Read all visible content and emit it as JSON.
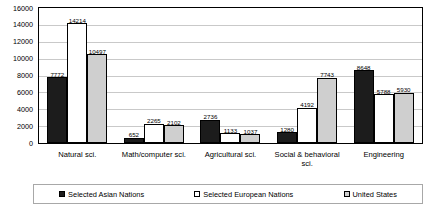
{
  "chart_data": {
    "type": "bar",
    "title": "",
    "xlabel": "",
    "ylabel": "",
    "ylim": [
      0,
      16000
    ],
    "ytick_step": 2000,
    "yticks": [
      "16000",
      "14000",
      "12000",
      "10000",
      "8000",
      "6000",
      "4000",
      "2000",
      "0"
    ],
    "grid": true,
    "legend_position": "bottom",
    "categories": [
      "Natural sci.",
      "Math/computer sci.",
      "Agricultural sci.",
      "Social & behavioral sci.",
      "Engineering"
    ],
    "series": [
      {
        "name": "Selected Asian Nations",
        "color": "#1c1c1c",
        "pattern": "solid-dark",
        "values": [
          7772,
          652,
          2736,
          1280,
          8648
        ],
        "labels": [
          "7772",
          "652",
          "2736",
          "1280",
          "8648"
        ]
      },
      {
        "name": "Selected European Nations",
        "color": "#ffffff",
        "pattern": "hollow",
        "values": [
          14214,
          2265,
          1133,
          4192,
          5788
        ],
        "labels": [
          "14214",
          "2265",
          "1133",
          "4192",
          "5788"
        ]
      },
      {
        "name": "United States",
        "color": "#cfcfcf",
        "pattern": "dotted-gray",
        "values": [
          10497,
          2102,
          1037,
          7743,
          5930
        ],
        "labels": [
          "10497",
          "2102",
          "1037",
          "7743",
          "5930"
        ]
      }
    ]
  }
}
